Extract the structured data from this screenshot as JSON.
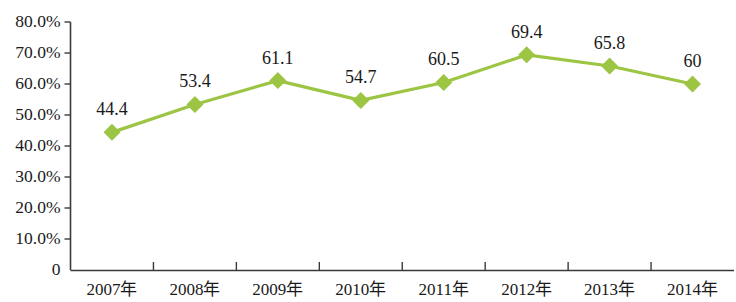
{
  "chart_data": {
    "type": "line",
    "title": "",
    "xlabel": "",
    "ylabel": "",
    "categories": [
      "2007年",
      "2008年",
      "2009年",
      "2010年",
      "2011年",
      "2012年",
      "2013年",
      "2014年"
    ],
    "values": [
      44.4,
      53.4,
      61.1,
      54.7,
      60.5,
      69.4,
      65.8,
      60
    ],
    "point_labels": [
      "44.4",
      "53.4",
      "61.1",
      "54.7",
      "60.5",
      "69.4",
      "65.8",
      "60"
    ],
    "ylim": [
      0,
      80
    ],
    "y_ticks": [
      0,
      10,
      20,
      30,
      40,
      50,
      60,
      70,
      80
    ],
    "y_tick_labels": [
      "0",
      "10.0%",
      "20.0%",
      "30.0%",
      "40.0%",
      "50.0%",
      "60.0%",
      "70.0%",
      "80.0%"
    ],
    "grid": false,
    "legend": "none",
    "series": [
      {
        "name": "",
        "values": [
          44.4,
          53.4,
          61.1,
          54.7,
          60.5,
          69.4,
          65.8,
          60
        ]
      }
    ],
    "colors": {
      "line": "#9DC544",
      "marker": "#9DC544",
      "axis": "#3a3a3a",
      "text": "#1a1a1a",
      "background": "#ffffff"
    },
    "marker_shape": "diamond"
  }
}
